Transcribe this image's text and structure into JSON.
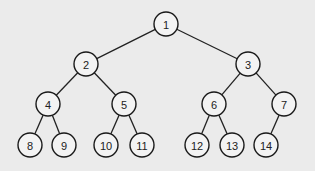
{
  "diagram": {
    "type": "binary-tree",
    "node_radius": 12,
    "nodes": [
      {
        "id": "1",
        "label": "1",
        "x": 166,
        "y": 24
      },
      {
        "id": "2",
        "label": "2",
        "x": 86,
        "y": 64
      },
      {
        "id": "3",
        "label": "3",
        "x": 248,
        "y": 64
      },
      {
        "id": "4",
        "label": "4",
        "x": 48,
        "y": 104
      },
      {
        "id": "5",
        "label": "5",
        "x": 124,
        "y": 104
      },
      {
        "id": "6",
        "label": "6",
        "x": 214,
        "y": 104
      },
      {
        "id": "7",
        "label": "7",
        "x": 284,
        "y": 104
      },
      {
        "id": "8",
        "label": "8",
        "x": 30,
        "y": 145
      },
      {
        "id": "9",
        "label": "9",
        "x": 64,
        "y": 145
      },
      {
        "id": "10",
        "label": "10",
        "x": 106,
        "y": 145
      },
      {
        "id": "11",
        "label": "11",
        "x": 142,
        "y": 145
      },
      {
        "id": "12",
        "label": "12",
        "x": 197,
        "y": 145
      },
      {
        "id": "13",
        "label": "13",
        "x": 232,
        "y": 145
      },
      {
        "id": "14",
        "label": "14",
        "x": 266,
        "y": 145
      }
    ],
    "edges": [
      [
        "1",
        "2"
      ],
      [
        "1",
        "3"
      ],
      [
        "2",
        "4"
      ],
      [
        "2",
        "5"
      ],
      [
        "3",
        "6"
      ],
      [
        "3",
        "7"
      ],
      [
        "4",
        "8"
      ],
      [
        "4",
        "9"
      ],
      [
        "5",
        "10"
      ],
      [
        "5",
        "11"
      ],
      [
        "6",
        "12"
      ],
      [
        "6",
        "13"
      ],
      [
        "7",
        "14"
      ]
    ]
  }
}
